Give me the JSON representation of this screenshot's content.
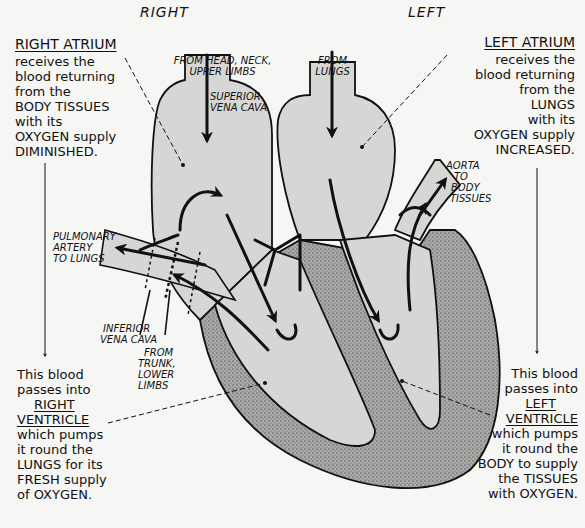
{
  "sides": {
    "right": "RIGHT",
    "left": "LEFT"
  },
  "right_atrium": {
    "title": "RIGHT ATRIUM",
    "lines": [
      "receives the",
      "blood returning",
      "from the",
      "BODY TISSUES",
      "with its",
      "OXYGEN supply",
      "DIMINISHED."
    ]
  },
  "left_atrium": {
    "title": "LEFT ATRIUM",
    "lines": [
      "receives the",
      "blood returning",
      "from the",
      "LUNGS",
      "with its",
      "OXYGEN supply",
      "INCREASED."
    ]
  },
  "right_ventricle": {
    "pre": [
      "This blood",
      "passes into"
    ],
    "title1": "RIGHT",
    "title2": "VENTRICLE",
    "lines": [
      "which pumps",
      "it round the",
      "LUNGS for its",
      "FRESH supply",
      "of OXYGEN."
    ]
  },
  "left_ventricle": {
    "pre": [
      "This blood",
      "passes into"
    ],
    "title1": "LEFT",
    "title2": "VENTRICLE",
    "lines": [
      "which pumps",
      "it round the",
      "BODY to supply",
      "the TISSUES",
      "with OXYGEN."
    ]
  },
  "vessel_labels": {
    "from_head": [
      "FROM HEAD, NECK,",
      "UPPER LIMBS"
    ],
    "superior_vena_cava": [
      "SUPERIOR",
      "VENA CAVA"
    ],
    "from_lungs": [
      "FROM",
      "LUNGS"
    ],
    "aorta": [
      "AORTA",
      "TO",
      "BODY",
      "TISSUES"
    ],
    "pulmonary_artery": [
      "PULMONARY",
      "ARTERY",
      "TO LUNGS"
    ],
    "inferior_vena_cava": [
      "INFERIOR",
      "VENA CAVA"
    ],
    "from_trunk": [
      "FROM",
      "TRUNK,",
      "LOWER",
      "LIMBS"
    ]
  },
  "colors": {
    "chamber_fill": "#d6d6d4",
    "muscle_fill": "#9a9a98",
    "ink": "#111111",
    "paper": "#f6f6f4"
  }
}
